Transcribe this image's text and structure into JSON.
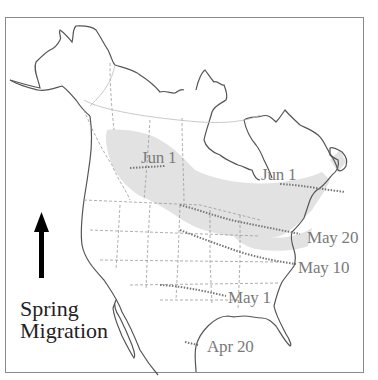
{
  "map": {
    "region": "North America",
    "colors": {
      "frame": "#8a8a8a",
      "coastline": "#555555",
      "state_borders": "#9a9a9a",
      "breeding_range": "#e2e2e2",
      "isochron": "#777777",
      "label": "#7a7a7a",
      "legend_text": "#222222",
      "arrow": "#000000"
    },
    "legend": {
      "line1": "Spring",
      "line2": "Migration",
      "arrow": "arrow-up-icon"
    },
    "isochron_labels": [
      {
        "id": "jun1-west",
        "text": "Jun 1"
      },
      {
        "id": "jun1-east",
        "text": "Jun 1"
      },
      {
        "id": "may20",
        "text": "May 20"
      },
      {
        "id": "may10",
        "text": "May 10"
      },
      {
        "id": "may1",
        "text": "May 1"
      },
      {
        "id": "apr20",
        "text": "Apr 20"
      }
    ]
  }
}
